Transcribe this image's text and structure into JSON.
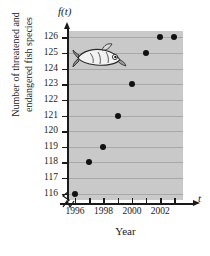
{
  "chart_data": {
    "type": "scatter",
    "title": "",
    "xlabel": "Year",
    "ylabel": "Number of threatened and endangered fish species",
    "axis_variable_y": "f(t)",
    "axis_variable_x": "t",
    "x": [
      1996,
      1997,
      1998,
      1999,
      2000,
      2001,
      2002,
      2003
    ],
    "values": [
      116,
      118,
      119,
      121,
      123,
      125,
      126,
      126
    ],
    "xlim": [
      1995.5,
      2003.6
    ],
    "ylim": [
      115.6,
      126.4
    ],
    "x_tick_values": [
      1996,
      1997,
      1998,
      1999,
      2000,
      2001,
      2002,
      2003
    ],
    "x_tick_labels": [
      "1996",
      "",
      "1998",
      "",
      "2000",
      "",
      "2002",
      ""
    ],
    "y_tick_values": [
      126,
      125,
      124,
      123,
      122,
      121,
      120,
      119,
      118,
      117,
      116
    ],
    "y_tick_labels": [
      "126",
      "125",
      "124",
      "123",
      "122",
      "121",
      "120",
      "119",
      "118",
      "117",
      "116"
    ],
    "grid": true,
    "grid_axis": "y",
    "legend": null,
    "axis_break_y": true,
    "axis_break_x": true,
    "marker": "filled-circle",
    "marker_color": "#111111",
    "plot_background": "#c9c9c9",
    "gridline_color": "#a8a8a8",
    "annotations": [
      {
        "name": "fish-clipart",
        "type": "image",
        "x": 1997.2,
        "y": 124.8
      }
    ]
  },
  "labels": {
    "y_axis_title_line1": "Number of threatened and",
    "y_axis_title_line2": "endangered fish species",
    "x_axis_title": "Year",
    "y_axis_variable": "f(t)",
    "x_axis_variable": "t"
  }
}
